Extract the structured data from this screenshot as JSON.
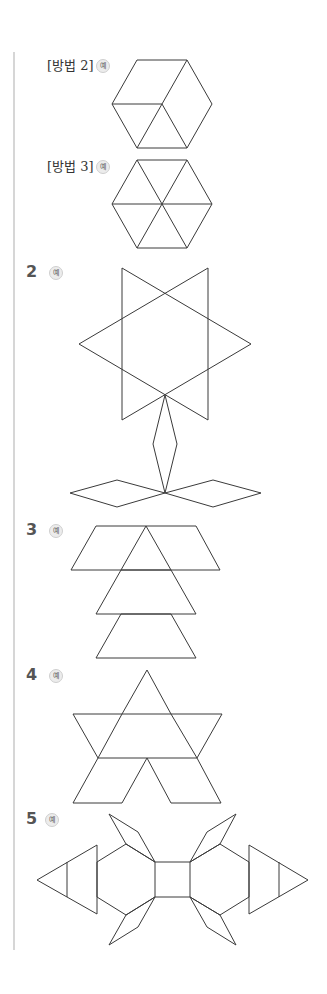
{
  "items": [
    {
      "id": "method2",
      "label": "[방법 2]",
      "badge": "예"
    },
    {
      "id": "method3",
      "label": "[방법 3]",
      "badge": "예"
    },
    {
      "id": "q2",
      "number": "2",
      "badge": "예"
    },
    {
      "id": "q3",
      "number": "3",
      "badge": "예"
    },
    {
      "id": "q4",
      "number": "4",
      "badge": "예"
    },
    {
      "id": "q5",
      "number": "5",
      "badge": "예"
    }
  ],
  "figures": {
    "method2": "hexagon divided into 3 rhombi and 2 triangles",
    "method3": "hexagon divided into 6 triangles",
    "q2": "star of two triangles with kite stem and two rhombus leaves",
    "q3": "trapezoid, triangle and stacked trapezoid/triangle tower",
    "q4": "star shape built from triangles and parallelograms",
    "q5": "symmetric shape with square center, hexagon halves, rhombi and triangles"
  },
  "colors": {
    "line": "#3a3a3a",
    "border": "#d6d6d6",
    "badge_bg": "#ececec"
  }
}
